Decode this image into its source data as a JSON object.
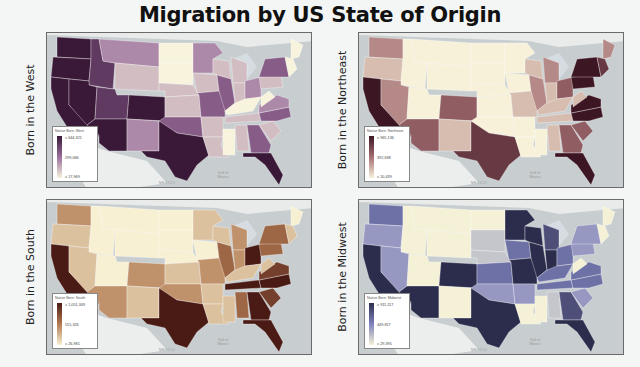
{
  "title": "Migration by US State of Origin",
  "panels": [
    {
      "id": "west",
      "side_label": "Born in the West",
      "legend_title": "Native Born: West",
      "legend_max": "≥ 644,321",
      "legend_mid": "299,066",
      "legend_min": "≤ 17,969",
      "colors": {
        "high": "#3a1838",
        "mid": "#9a6e9c",
        "low": "#f7f3dc"
      },
      "map_label": "MEXICO",
      "gulf_label": "Gulf of Mexico"
    },
    {
      "id": "northeast",
      "side_label": "Born in the Northeast",
      "legend_title": "Native Born: Northeast",
      "legend_max": "≥ 965,136",
      "legend_mid": "392,638",
      "legend_min": "≤ 10,439",
      "colors": {
        "high": "#3d1624",
        "mid": "#a56f72",
        "low": "#f7f1d9"
      },
      "map_label": "MEXICO",
      "gulf_label": "Gulf of Mexico"
    },
    {
      "id": "south",
      "side_label": "Born in the South",
      "legend_title": "Native Born: South",
      "legend_max": "≥ 1,051,349",
      "legend_mid": "515,326",
      "legend_min": "≤ 26,981",
      "colors": {
        "high": "#4a1a14",
        "mid": "#b27a52",
        "low": "#f8f0d2"
      },
      "map_label": "MEXICO",
      "gulf_label": "Gulf of Mexico"
    },
    {
      "id": "midwest",
      "side_label": "Born in the Midwest",
      "legend_title": "Native Born: Midwest",
      "legend_max": "≥ 911,117",
      "legend_mid": "449,817",
      "legend_min": "≤ 29,395",
      "colors": {
        "high": "#2c2d4c",
        "mid": "#7f82bd",
        "low": "#f4f1d6"
      },
      "map_label": "MEXICO",
      "gulf_label": "Gulf of Mexico"
    }
  ],
  "state_levels": {
    "west": {
      "WA": 5,
      "OR": 5,
      "CA": 5,
      "ID": 4,
      "NV": 5,
      "MT": 2,
      "WY": 1,
      "UT": 4,
      "AZ": 5,
      "CO": 5,
      "NM": 2,
      "ND": 0,
      "SD": 0,
      "NE": 1,
      "KS": 1,
      "OK": 3,
      "TX": 5,
      "MN": 2,
      "IA": 1,
      "MO": 3,
      "AR": 1,
      "LA": 1,
      "WI": 1,
      "IL": 3,
      "MS": 0,
      "MI": 1,
      "IN": 1,
      "OH": 2,
      "KY": 0,
      "TN": 1,
      "AL": 1,
      "GA": 3,
      "FL": 5,
      "SC": 1,
      "NC": 3,
      "VA": 2,
      "WV": 0,
      "PA": 1,
      "NY": 3,
      "ME": 0,
      "NE6": 0
    },
    "northeast": {
      "WA": 2,
      "OR": 1,
      "CA": 5,
      "ID": 0,
      "NV": 2,
      "MT": 0,
      "WY": 0,
      "UT": 0,
      "AZ": 3,
      "CO": 3,
      "NM": 1,
      "ND": 0,
      "SD": 0,
      "NE": 0,
      "KS": 0,
      "OK": 0,
      "TX": 4,
      "MN": 0,
      "IA": 0,
      "MO": 1,
      "AR": 0,
      "LA": 0,
      "WI": 1,
      "IL": 2,
      "MS": 0,
      "MI": 2,
      "IN": 1,
      "OH": 3,
      "KY": 1,
      "TN": 1,
      "AL": 1,
      "GA": 3,
      "FL": 5,
      "SC": 3,
      "NC": 5,
      "VA": 5,
      "WV": 1,
      "PA": 5,
      "NY": 5,
      "ME": 2,
      "NE6": 4
    },
    "south": {
      "WA": 2,
      "OR": 1,
      "CA": 5,
      "ID": 0,
      "NV": 1,
      "MT": 0,
      "WY": 0,
      "UT": 0,
      "AZ": 2,
      "CO": 2,
      "NM": 1,
      "ND": 0,
      "SD": 0,
      "NE": 0,
      "KS": 1,
      "OK": 2,
      "TX": 5,
      "MN": 1,
      "IA": 0,
      "MO": 2,
      "AR": 1,
      "LA": 1,
      "WI": 1,
      "IL": 3,
      "MS": 1,
      "MI": 2,
      "IN": 2,
      "OH": 5,
      "KY": 1,
      "TN": 5,
      "AL": 3,
      "GA": 5,
      "FL": 5,
      "SC": 4,
      "NC": 5,
      "VA": 4,
      "WV": 1,
      "PA": 3,
      "NY": 3,
      "ME": 0,
      "NE6": 1
    },
    "midwest": {
      "WA": 3,
      "OR": 2,
      "CA": 5,
      "ID": 0,
      "NV": 2,
      "MT": 0,
      "WY": 0,
      "UT": 0,
      "AZ": 5,
      "CO": 5,
      "NM": 0,
      "ND": 0,
      "SD": 1,
      "NE": 1,
      "KS": 3,
      "OK": 2,
      "TX": 5,
      "MN": 5,
      "IA": 3,
      "MO": 5,
      "AR": 2,
      "LA": 0,
      "WI": 5,
      "IL": 5,
      "MS": 0,
      "MI": 4,
      "IN": 5,
      "OH": 3,
      "KY": 3,
      "TN": 3,
      "AL": 1,
      "GA": 4,
      "FL": 5,
      "SC": 2,
      "NC": 3,
      "VA": 3,
      "WV": 0,
      "PA": 2,
      "NY": 2,
      "ME": 0,
      "NE6": 0
    }
  }
}
